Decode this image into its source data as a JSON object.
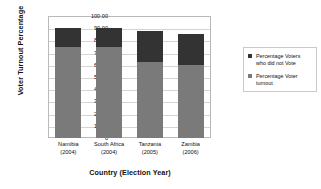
{
  "chart_data": {
    "type": "bar",
    "title": "",
    "xlabel": "Country (Election Year)",
    "ylabel": "Voter Turnout Percentage",
    "ylim": [
      0,
      100
    ],
    "ytick_labels": [
      "100.00",
      "90.00",
      "80.00",
      "70.00",
      "60.00",
      "50.00",
      "40.00",
      "30.00",
      "20.00",
      "10.00",
      "0"
    ],
    "ytick_values": [
      100,
      90,
      80,
      70,
      60,
      50,
      40,
      30,
      20,
      10,
      0
    ],
    "categories": [
      "Namibia (2004)",
      "South Africa (2004)",
      "Tanzania (2005)",
      "Zambia (2006)"
    ],
    "category_lines": [
      [
        "Namibia",
        "(2004)"
      ],
      [
        "South Africa",
        "(2004)"
      ],
      [
        "Tanzania",
        "(2005)"
      ],
      [
        "Zambia",
        "(2006)"
      ]
    ],
    "stacked": true,
    "grid": true,
    "legend_position": "right",
    "series": [
      {
        "name": "Percentage Voter turnout",
        "color": "#7a7a7a",
        "values": [
          75,
          75,
          62,
          60
        ]
      },
      {
        "name": "Percentage Voters who did not Vote",
        "color": "#333333",
        "values": [
          15,
          15,
          26,
          25
        ]
      }
    ],
    "bar_totals": [
      90,
      90,
      88,
      85
    ]
  },
  "legend": {
    "entries": [
      {
        "label_line1": "Percentage Voters",
        "label_line2": "who did not Vote",
        "color": "#333333"
      },
      {
        "label_line1": "Percentage Voter",
        "label_line2": "turnout",
        "color": "#7a7a7a"
      }
    ]
  }
}
